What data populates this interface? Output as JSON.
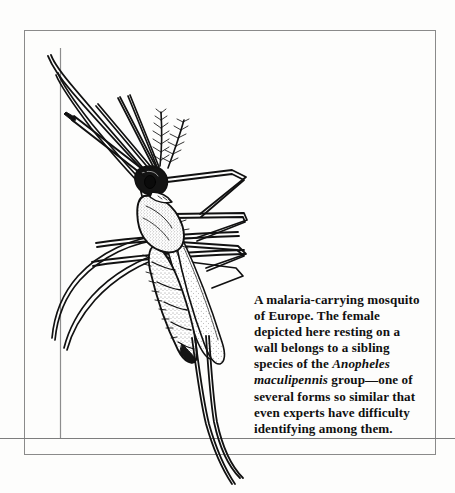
{
  "figure": {
    "type": "scientific-illustration",
    "medium": "pen-and-ink line drawing",
    "alt": "Pen-and-ink drawing of a female Anopheles mosquito resting head-down on a wall at an angle, with long legs, feathery antennae, spotted wings and a segmented abdomen."
  },
  "caption": {
    "lines": [
      "A malaria-carrying mosquito",
      "of Europe. The female",
      "depicted here resting on a",
      "wall belongs to a sibling spe-",
      "cies of the Anopheles maculi-",
      "pennis group—one of several",
      "forms so similar that even",
      "experts have difficulty identi-",
      "fying among them."
    ],
    "segments": [
      {
        "text": "A malaria-carrying mosquito of Europe. The female depicted here resting on a wall belongs to a sibling species of the ",
        "style": "roman"
      },
      {
        "text": "Anopheles maculipennis",
        "style": "italic"
      },
      {
        "text": " group—one of several forms so similar that even experts have difficulty identifying among them.",
        "style": "roman"
      }
    ],
    "species_name": "Anopheles maculipennis",
    "full_text": "A malaria-carrying mosquito of Europe. The female depicted here resting on a wall belongs to a sibling species of the Anopheles maculipennis group—one of several forms so similar that even experts have difficulty identifying among them."
  },
  "colors": {
    "page_background": "#fdfdfc",
    "frame_border": "#8a8a8a",
    "ink": "#111111",
    "wall_line": "#8d8d8d",
    "caption_text": "#101010"
  }
}
